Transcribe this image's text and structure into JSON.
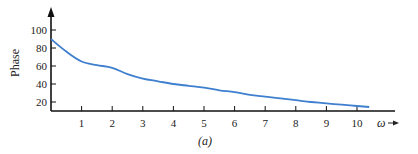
{
  "chart_data": {
    "type": "line",
    "title": "",
    "caption": "(a)",
    "xlabel": "ω",
    "ylabel": "Phase",
    "x_ticks": [
      1,
      2,
      3,
      4,
      5,
      6,
      7,
      8,
      9,
      10
    ],
    "y_ticks": [
      20,
      40,
      60,
      80,
      100
    ],
    "xlim": [
      0,
      10.4
    ],
    "ylim": [
      11,
      110
    ],
    "grid": false,
    "legend": null,
    "series": [
      {
        "name": "Phase",
        "color": "#3f7fcf",
        "x": [
          0,
          0.5,
          1,
          1.5,
          2,
          2.5,
          3,
          3.5,
          4,
          4.5,
          5,
          5.5,
          6,
          6.5,
          7,
          7.5,
          8,
          8.5,
          9,
          9.5,
          10,
          10.4
        ],
        "y": [
          90,
          76,
          65,
          61,
          58,
          51,
          46,
          43,
          40,
          38,
          36,
          33,
          31,
          28,
          26,
          24,
          22,
          20,
          18.5,
          17,
          15.5,
          14.5
        ]
      }
    ]
  }
}
